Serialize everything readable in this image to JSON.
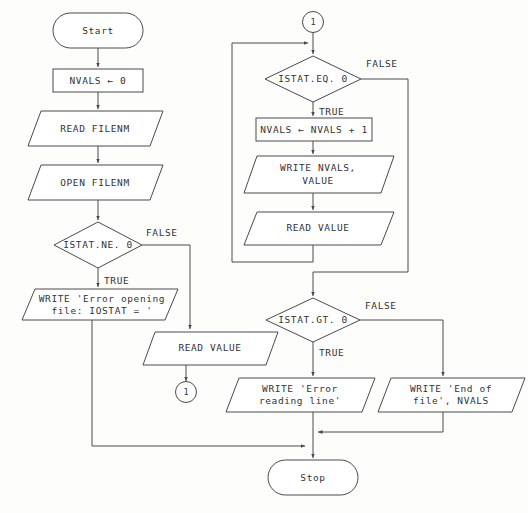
{
  "diagram": {
    "stroke_color": "#4a4a4a",
    "text_color": "#333333",
    "background_color": "#fdfdfc"
  },
  "nodes": {
    "start": {
      "label": "Start",
      "shape": "terminator"
    },
    "init_nvals": {
      "label": "NVALS ← 0",
      "shape": "process"
    },
    "read_filenm": {
      "label": "READ FILENM",
      "shape": "io"
    },
    "open_filenm": {
      "label": "OPEN FILENM",
      "shape": "io"
    },
    "istat_ne_0": {
      "label": "ISTAT.NE. 0",
      "shape": "decision"
    },
    "write_error_opening": {
      "line1": "WRITE 'Error opening",
      "line2": "file: IOSTAT = '",
      "shape": "io"
    },
    "read_value_first": {
      "label": "READ VALUE",
      "shape": "io"
    },
    "connector_out": {
      "label": "1",
      "shape": "connector"
    },
    "connector_in": {
      "label": "1",
      "shape": "connector"
    },
    "istat_eq_0": {
      "label": "ISTAT.EQ. 0",
      "shape": "decision"
    },
    "increment_nvals": {
      "label": "NVALS ← NVALS + 1",
      "shape": "process"
    },
    "write_nvals_value": {
      "line1": "WRITE NVALS,",
      "line2": "VALUE",
      "shape": "io"
    },
    "read_value_loop": {
      "label": "READ VALUE",
      "shape": "io"
    },
    "istat_gt_0": {
      "label": "ISTAT.GT. 0",
      "shape": "decision"
    },
    "write_error_reading": {
      "line1": "WRITE 'Error",
      "line2": "reading line'",
      "shape": "io"
    },
    "write_end_of_file": {
      "line1": "WRITE 'End of",
      "line2": "file', NVALS",
      "shape": "io"
    },
    "stop": {
      "label": "Stop",
      "shape": "terminator"
    }
  },
  "edge_labels": {
    "ne_false": "FALSE",
    "ne_true": "TRUE",
    "eq_false": "FALSE",
    "eq_true": "TRUE",
    "gt_false": "FALSE",
    "gt_true": "TRUE"
  }
}
